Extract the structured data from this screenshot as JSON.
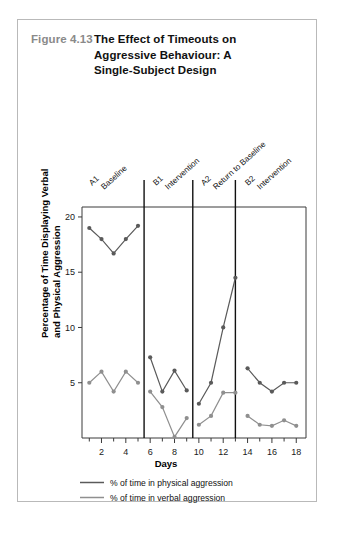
{
  "figure": {
    "number": "Figure 4.13",
    "title_lines": [
      "The Effect of Timeouts on",
      "Aggressive Behaviour: A",
      "Single-Subject Design"
    ],
    "number_color": "#8a8a8a",
    "title_color": "#111111",
    "border_color": "#b9b9b9"
  },
  "chart_data": {
    "type": "line",
    "title": "The Effect of Timeouts on Aggressive Behaviour: A Single-Subject Design",
    "xlabel": "Days",
    "ylabel": "Percentage of Time Displaying Verbal and Physical Aggression",
    "x": [
      1,
      2,
      3,
      4,
      5,
      6,
      7,
      8,
      9,
      10,
      11,
      12,
      13,
      14,
      15,
      16,
      17,
      18
    ],
    "xlim": [
      0.4,
      18.8
    ],
    "ylim": [
      0,
      20.9
    ],
    "xticks": [
      2,
      4,
      6,
      8,
      10,
      12,
      14,
      16,
      18
    ],
    "xtick_labels": [
      "2",
      "4",
      "6",
      "8",
      "10",
      "12",
      "14",
      "16",
      "18"
    ],
    "xminor_ticks": [
      1,
      3,
      5,
      7,
      9,
      11,
      13,
      15,
      17
    ],
    "yticks": [
      5,
      10,
      15,
      20
    ],
    "ytick_labels": [
      "5",
      "10",
      "15",
      "20"
    ],
    "grid": false,
    "legend_position": "below-plot",
    "series": [
      {
        "name": "% of time in physical aggression",
        "color": "#5a5a5a",
        "values": [
          19.0,
          18.0,
          16.7,
          18.0,
          19.2,
          7.3,
          4.2,
          6.1,
          4.3,
          3.1,
          5.0,
          10.0,
          14.5,
          6.3,
          5.0,
          4.2,
          5.0,
          5.0
        ]
      },
      {
        "name": "% of time in verbal aggression",
        "color": "#8f8f8f",
        "values": [
          5.0,
          6.0,
          4.2,
          6.0,
          5.0,
          4.2,
          2.8,
          0.1,
          1.8,
          1.2,
          2.0,
          4.1,
          4.1,
          2.0,
          1.2,
          1.1,
          1.6,
          1.1
        ]
      }
    ],
    "phases": [
      {
        "code": "A1",
        "name": "Baseline",
        "start": 1,
        "end": 5
      },
      {
        "code": "B1",
        "name": "Intervention",
        "start": 6,
        "end": 9
      },
      {
        "code": "A2",
        "name": "Return to Baseline",
        "start": 10,
        "end": 13
      },
      {
        "code": "B2",
        "name": "Intervention",
        "start": 13,
        "end": 18
      }
    ],
    "phase_dividers": [
      5.5,
      9.5,
      13.0
    ],
    "annotations": []
  },
  "legend": {
    "items": [
      {
        "label": "% of time in physical aggression",
        "color": "#5a5a5a"
      },
      {
        "label": "% of time in verbal aggression",
        "color": "#8f8f8f"
      }
    ]
  }
}
